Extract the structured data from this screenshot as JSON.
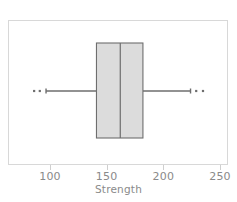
{
  "chart_data": {
    "type": "box",
    "title": "",
    "xlabel": "Strength",
    "ylabel": "",
    "orientation": "horizontal",
    "xlim": [
      70,
      260
    ],
    "grid": false,
    "legend": false,
    "axis": {
      "ticks": [
        100,
        150,
        200,
        250
      ],
      "tick_labels": [
        "100",
        "150",
        "200",
        "250"
      ]
    },
    "boxes": [
      {
        "name": "Strength",
        "min_whisker": 96.5,
        "q1": 141,
        "median": 162,
        "q3": 182,
        "max_whisker": 224,
        "outliers": [
          86,
          91,
          229,
          235
        ]
      }
    ],
    "colors": {
      "box_fill": "#dcdcdc",
      "box_edge": "#6e6e6e",
      "median": "#6e6e6e",
      "whisker": "#6e6e6e",
      "outlier": "#6e6e6e",
      "frame": "#d8d8d8",
      "tick": "#cfcfcf",
      "text": "#8a8a8a",
      "background": "#ffffff"
    }
  }
}
